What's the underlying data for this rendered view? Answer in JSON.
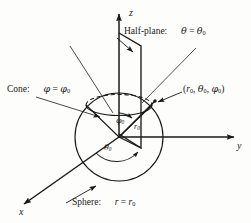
{
  "figure": {
    "background_color": "#fdfdfb",
    "line_color": "#1a1a1a",
    "axes": {
      "z_label": "z",
      "y_label": "y",
      "x_label": "x"
    },
    "annotations": {
      "halfplane": "Half-plane:",
      "halfplane_eq_lhs": "θ",
      "halfplane_eq_op": "=",
      "halfplane_eq_rhs": "θ",
      "halfplane_eq_sub": "0",
      "cone": "Cone:",
      "cone_eq_lhs": "φ",
      "cone_eq_op": "=",
      "cone_eq_rhs": "φ",
      "cone_eq_sub": "0",
      "sphere": "Sphere:",
      "sphere_eq_lhs": "r",
      "sphere_eq_op": "=",
      "sphere_eq_rhs": "r",
      "sphere_eq_sub": "0",
      "point_open": "(",
      "point_r": "r",
      "point_r_sub": "0",
      "point_sep1": ", ",
      "point_theta": "θ",
      "point_theta_sub": "0",
      "point_sep2": ", ",
      "point_phi": "φ",
      "point_phi_sub": "0",
      "point_close": ")",
      "angle_phi": "φ",
      "angle_phi_sub": "0",
      "radius_r": "r",
      "radius_r_sub": "0",
      "angle_theta": "θ",
      "angle_theta_sub": "0"
    },
    "geometry": {
      "origin_x": 119,
      "origin_y": 137,
      "sphere_radius": 44,
      "point_x": 155,
      "point_y": 101
    }
  }
}
